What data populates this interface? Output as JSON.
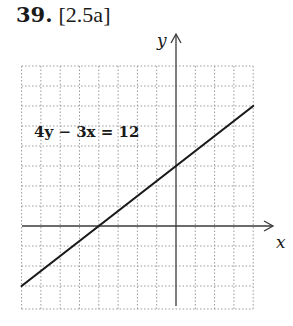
{
  "problem": {
    "number": "39.",
    "reference": "[2.5a]"
  },
  "chart_data": {
    "type": "line",
    "title": "",
    "equation": "4y − 3x = 12",
    "xlabel": "x",
    "ylabel": "y",
    "xlim": [
      -8,
      4
    ],
    "ylim": [
      -4,
      8
    ],
    "grid": true,
    "grid_style": "dotted",
    "series": [
      {
        "name": "4y − 3x = 12",
        "x": [
          -8,
          -4,
          0,
          4
        ],
        "y": [
          -3,
          0,
          3,
          6
        ]
      }
    ],
    "intercepts": {
      "x": -4,
      "y": 3
    }
  }
}
